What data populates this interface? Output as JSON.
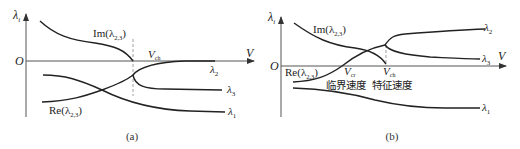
{
  "figure": {
    "panels": [
      {
        "id": "a",
        "caption": "(a)",
        "axis": {
          "y_label": "λ",
          "y_label_sub": "i",
          "x_label": "V",
          "origin_label": "O"
        },
        "labels": {
          "im": "Im(λ",
          "im_sub": "2,3",
          "im_close": ")",
          "re": "Re(λ",
          "re_sub": "2,3",
          "re_close": ")",
          "v_ch": "V",
          "v_ch_sub": "ch",
          "lambda2": "λ",
          "lambda2_sub": "2",
          "lambda3": "λ",
          "lambda3_sub": "3",
          "lambda1": "λ",
          "lambda1_sub": "1"
        }
      },
      {
        "id": "b",
        "caption": "(b)",
        "axis": {
          "y_label": "λ",
          "y_label_sub": "i",
          "x_label": "V",
          "origin_label": "O"
        },
        "labels": {
          "im": "Im(λ",
          "im_sub": "2,3",
          "im_close": ")",
          "re": "Re(λ",
          "re_sub": "2,3",
          "re_close": ")",
          "v_cr": "V",
          "v_cr_sub": "cr",
          "v_ch": "V",
          "v_ch_sub": "ch",
          "critical_speed": "临界速度",
          "characteristic_speed": "特征速度",
          "lambda2": "λ",
          "lambda2_sub": "2",
          "lambda3": "λ",
          "lambda3_sub": "3",
          "lambda1": "λ",
          "lambda1_sub": "1"
        }
      }
    ],
    "colors": {
      "curve": "#222222",
      "axis": "#555555",
      "dashed": "#888888",
      "background": "#ffffff"
    }
  }
}
